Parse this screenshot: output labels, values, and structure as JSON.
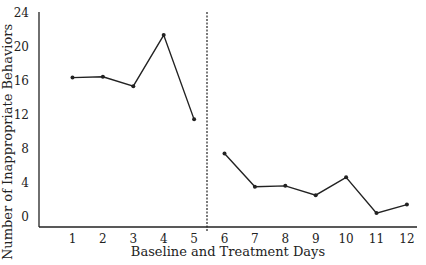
{
  "chart_data": {
    "type": "line",
    "title": "",
    "xlabel": "Baseline and Treatment Days",
    "ylabel": "Number of Inappropriate Behaviors",
    "x": [
      1,
      2,
      3,
      4,
      5,
      6,
      7,
      8,
      9,
      10,
      11,
      12
    ],
    "categories": [
      "1",
      "2",
      "3",
      "4",
      "5",
      "6",
      "7",
      "8",
      "9",
      "10",
      "11",
      "12"
    ],
    "series": [
      {
        "name": "Baseline",
        "x": [
          1,
          2,
          3,
          4,
          5
        ],
        "values": [
          16.3,
          16.4,
          15.3,
          21.3,
          11.4
        ]
      },
      {
        "name": "Treatment",
        "x": [
          6,
          7,
          8,
          9,
          10,
          11,
          12
        ],
        "values": [
          7.4,
          3.5,
          3.6,
          2.5,
          4.6,
          0.4,
          1.4
        ]
      }
    ],
    "ylim": [
      0,
      24
    ],
    "yticks": [
      0,
      4,
      8,
      12,
      16,
      20,
      24
    ],
    "xticks": [
      1,
      2,
      3,
      4,
      5,
      6,
      7,
      8,
      9,
      10,
      11,
      12
    ],
    "grid": false,
    "legend": null,
    "annotations": [
      {
        "type": "vertical-dashed-line",
        "x": 5.5,
        "label": "phase change (baseline / treatment)"
      }
    ]
  },
  "colors": {
    "line": "#222222",
    "axis": "#222222",
    "background": "#ffffff"
  }
}
